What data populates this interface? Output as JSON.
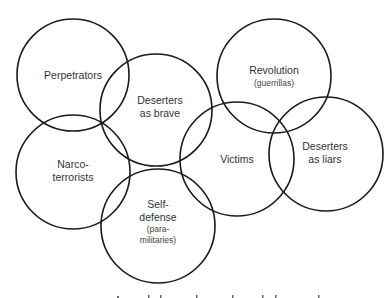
{
  "diagram": {
    "type": "overlapping-circles",
    "stroke_color": "#1a1a1a",
    "text_color": "#333333",
    "circles": [
      {
        "id": "perpetrators",
        "cx": 73,
        "cy": 75,
        "r": 56,
        "lines": [
          "Perpetrators"
        ],
        "sub": []
      },
      {
        "id": "deserters-brave",
        "cx": 156,
        "cy": 110,
        "r": 56,
        "lines": [
          "Deserters",
          "as brave"
        ],
        "sub": []
      },
      {
        "id": "narco-terrorists",
        "cx": 73,
        "cy": 172,
        "r": 57,
        "lines": [
          "Narco-",
          "terrorists"
        ],
        "sub": []
      },
      {
        "id": "self-defense",
        "cx": 158,
        "cy": 226,
        "r": 57,
        "lines": [
          "Self-",
          "defense"
        ],
        "sub": [
          "(para-",
          "militaries)"
        ]
      },
      {
        "id": "revolution",
        "cx": 274,
        "cy": 76,
        "r": 57,
        "lines": [
          "Revolution"
        ],
        "sub": [
          "(guerrillas)"
        ]
      },
      {
        "id": "victims",
        "cx": 237,
        "cy": 159,
        "r": 57,
        "lines": [
          "Victims"
        ],
        "sub": []
      },
      {
        "id": "deserters-liars",
        "cx": 326,
        "cy": 154,
        "r": 57,
        "lines": [
          "Deserters",
          "as liars"
        ],
        "sub": []
      }
    ]
  },
  "labels": {
    "perpetrators": "Perpetrators",
    "deserters_brave_1": "Deserters",
    "deserters_brave_2": "as brave",
    "narco_1": "Narco-",
    "narco_2": "terrorists",
    "self_defense_1": "Self-",
    "self_defense_2": "defense",
    "self_defense_sub_1": "(para-",
    "self_defense_sub_2": "militaries)",
    "revolution": "Revolution",
    "revolution_sub": "(guerrillas)",
    "victims": "Victims",
    "deserters_liars_1": "Deserters",
    "deserters_liars_2": "as liars"
  }
}
